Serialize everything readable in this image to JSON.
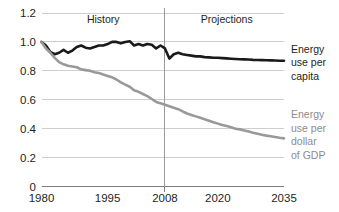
{
  "chart_data": {
    "type": "line",
    "title": "",
    "xlabel": "",
    "ylabel": "",
    "xlim": [
      1980,
      2035
    ],
    "ylim": [
      0,
      1.2
    ],
    "grid": true,
    "legend_position": "right-inline",
    "y_ticks": [
      "0",
      "0.2",
      "0.4",
      "0.6",
      "0.8",
      "1.0",
      "1.2"
    ],
    "y_tick_values": [
      0,
      0.2,
      0.4,
      0.6,
      0.8,
      1.0,
      1.2
    ],
    "x_ticks": [
      "1980",
      "1995",
      "2008",
      "2020",
      "2035"
    ],
    "x_tick_values": [
      1980,
      1995,
      2008,
      2020,
      2035
    ],
    "annotations": [
      {
        "name": "history-label",
        "text": "History",
        "x": 1994,
        "y": 1.13
      },
      {
        "name": "projections-label",
        "text": "Projections",
        "x": 2022,
        "y": 1.13
      },
      {
        "name": "divider-line",
        "text": "",
        "x": 2008,
        "y": 0
      }
    ],
    "divider_x": 2008,
    "series": [
      {
        "name": "Energy use per capita",
        "label_lines": [
          "Energy",
          "use per",
          "capita"
        ],
        "color": "#1a1a1a",
        "width": 2.6,
        "x": [
          1980,
          1981,
          1982,
          1983,
          1984,
          1985,
          1986,
          1987,
          1988,
          1989,
          1990,
          1991,
          1992,
          1993,
          1994,
          1995,
          1996,
          1997,
          1998,
          1999,
          2000,
          2001,
          2002,
          2003,
          2004,
          2005,
          2006,
          2007,
          2008,
          2009,
          2010,
          2011,
          2012,
          2013,
          2014,
          2015,
          2016,
          2017,
          2018,
          2019,
          2020,
          2021,
          2022,
          2023,
          2024,
          2025,
          2026,
          2027,
          2028,
          2029,
          2030,
          2031,
          2032,
          2033,
          2034,
          2035
        ],
        "y": [
          1.0,
          0.975,
          0.93,
          0.915,
          0.925,
          0.945,
          0.925,
          0.94,
          0.965,
          0.975,
          0.96,
          0.955,
          0.965,
          0.975,
          0.975,
          0.985,
          1.0,
          1.0,
          0.99,
          1.0,
          1.005,
          0.975,
          0.985,
          0.975,
          0.985,
          0.98,
          0.955,
          0.975,
          0.955,
          0.885,
          0.915,
          0.925,
          0.915,
          0.91,
          0.905,
          0.9,
          0.9,
          0.895,
          0.893,
          0.89,
          0.89,
          0.888,
          0.886,
          0.884,
          0.882,
          0.88,
          0.879,
          0.878,
          0.876,
          0.875,
          0.874,
          0.873,
          0.872,
          0.871,
          0.87,
          0.87
        ]
      },
      {
        "name": "Energy use per dollar of GDP",
        "label_lines": [
          "Energy",
          "use per",
          "dollar",
          "of GDP"
        ],
        "color": "#999999",
        "width": 2.6,
        "x": [
          1980,
          1981,
          1982,
          1983,
          1984,
          1985,
          1986,
          1987,
          1988,
          1989,
          1990,
          1991,
          1992,
          1993,
          1994,
          1995,
          1996,
          1997,
          1998,
          1999,
          2000,
          2001,
          2002,
          2003,
          2004,
          2005,
          2006,
          2007,
          2008,
          2009,
          2010,
          2011,
          2012,
          2013,
          2014,
          2015,
          2016,
          2017,
          2018,
          2019,
          2020,
          2021,
          2022,
          2023,
          2024,
          2025,
          2026,
          2027,
          2028,
          2029,
          2030,
          2031,
          2032,
          2033,
          2034,
          2035
        ],
        "y": [
          1.0,
          0.955,
          0.925,
          0.89,
          0.86,
          0.845,
          0.835,
          0.83,
          0.825,
          0.81,
          0.805,
          0.8,
          0.79,
          0.785,
          0.775,
          0.765,
          0.755,
          0.74,
          0.72,
          0.705,
          0.69,
          0.665,
          0.655,
          0.64,
          0.625,
          0.605,
          0.585,
          0.575,
          0.565,
          0.555,
          0.545,
          0.535,
          0.52,
          0.505,
          0.495,
          0.485,
          0.475,
          0.465,
          0.455,
          0.445,
          0.435,
          0.425,
          0.418,
          0.41,
          0.4,
          0.395,
          0.388,
          0.38,
          0.372,
          0.365,
          0.358,
          0.352,
          0.348,
          0.342,
          0.337,
          0.333
        ]
      }
    ]
  }
}
